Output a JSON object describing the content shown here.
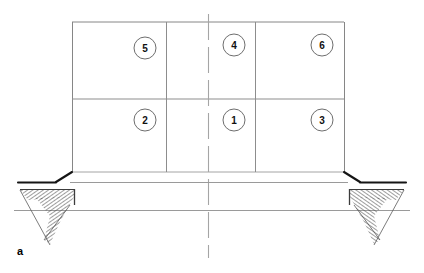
{
  "figure": {
    "panel_label": "a",
    "type": "engineering-section-drawing",
    "colors": {
      "background": "#ffffff",
      "line": "#7a7a7a",
      "line_dark": "#1a1a1a",
      "hatch": "#555555",
      "text": "#111111"
    }
  },
  "callouts": [
    {
      "id": "callout-5",
      "label": "5",
      "cx": 145,
      "cy": 48,
      "r": 11
    },
    {
      "id": "callout-4",
      "label": "4",
      "cx": 234,
      "cy": 45,
      "r": 11
    },
    {
      "id": "callout-6",
      "label": "6",
      "cx": 322,
      "cy": 45,
      "r": 11
    },
    {
      "id": "callout-2",
      "label": "2",
      "cx": 145,
      "cy": 120,
      "r": 11
    },
    {
      "id": "callout-1",
      "label": "1",
      "cx": 234,
      "cy": 120,
      "r": 11
    },
    {
      "id": "callout-3",
      "label": "3",
      "cx": 322,
      "cy": 120,
      "r": 11
    }
  ],
  "geometry": {
    "wall_left_x": 72,
    "wall_right_x": 344,
    "wall_top_y": 22,
    "wall_bottom_y": 172,
    "divider_mid_y": 99,
    "divider_v1_x": 166,
    "divider_v2_x": 255,
    "centerline_x": 208,
    "centerline_top_y": 14,
    "centerline_bottom_y": 258,
    "slab_top_y": 181,
    "slab_bottom_y": 210,
    "slab_left_x": 18,
    "slab_right_x": 406,
    "ground_left_x": 14,
    "ground_right_x": 410
  }
}
